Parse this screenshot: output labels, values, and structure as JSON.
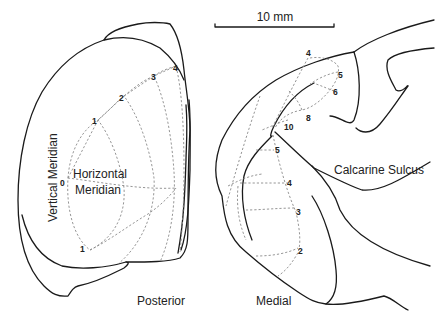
{
  "scale_bar": {
    "label": "10 mm"
  },
  "left_panel": {
    "labels": {
      "vertical_meridian": "Vertical Meridian",
      "horizontal_meridian_line1": "Horizontal",
      "horizontal_meridian_line2": "Meridian",
      "view": "Posterior"
    },
    "eccentricity_ticks": [
      "0",
      "1",
      "2",
      "3",
      "4",
      "1"
    ]
  },
  "right_panel": {
    "labels": {
      "calcarine_sulcus": "Calcarine Sulcus",
      "view": "Medial"
    },
    "eccentricity_ticks_upper": [
      "4",
      "5",
      "6",
      "8",
      "10"
    ],
    "eccentricity_ticks_lower": [
      "5",
      "4",
      "3",
      "2"
    ]
  }
}
